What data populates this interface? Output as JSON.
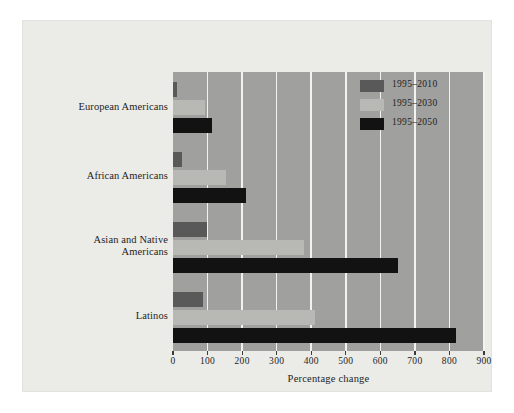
{
  "chart_data": {
    "type": "bar",
    "orientation": "horizontal",
    "title": "",
    "xlabel": "Percentage change",
    "ylabel": "",
    "xlim": [
      0,
      900
    ],
    "xticks": [
      0,
      100,
      200,
      300,
      400,
      500,
      600,
      700,
      800,
      900
    ],
    "xticklabels": [
      "0",
      "100",
      "200",
      "300",
      "400",
      "500",
      "600",
      "700",
      "800",
      "900"
    ],
    "grid": "vertical",
    "legend_position": "top-right",
    "categories": [
      "European Americans",
      "African Americans",
      "Asian and Native Americans",
      "Latinos"
    ],
    "category_lines": [
      [
        "European Americans"
      ],
      [
        "African Americans"
      ],
      [
        "Asian and Native",
        "Americans"
      ],
      [
        "Latinos"
      ]
    ],
    "series": [
      {
        "name": "1995–2010",
        "color": "#595959",
        "values": [
          12,
          25,
          98,
          88
        ]
      },
      {
        "name": "1995–2030",
        "color": "#b8b8b5",
        "values": [
          93,
          152,
          378,
          412
        ]
      },
      {
        "name": "1995–2050",
        "color": "#121212",
        "values": [
          113,
          212,
          650,
          818
        ]
      }
    ]
  },
  "legend": {
    "items": [
      {
        "label": "1995–2010",
        "swatch": "s1"
      },
      {
        "label": "1995–2030",
        "swatch": "s2"
      },
      {
        "label": "1995–2050",
        "swatch": "s3"
      }
    ]
  },
  "axis": {
    "xlabel": "Percentage change"
  },
  "colors": {
    "plot_background": "#a0a09e",
    "figure_background": "#ebebe8",
    "gridline": "#f2f2ef",
    "series_1995_2010": "#595959",
    "series_1995_2030": "#b8b8b5",
    "series_1995_2050": "#121212",
    "text": "#241f1c"
  }
}
